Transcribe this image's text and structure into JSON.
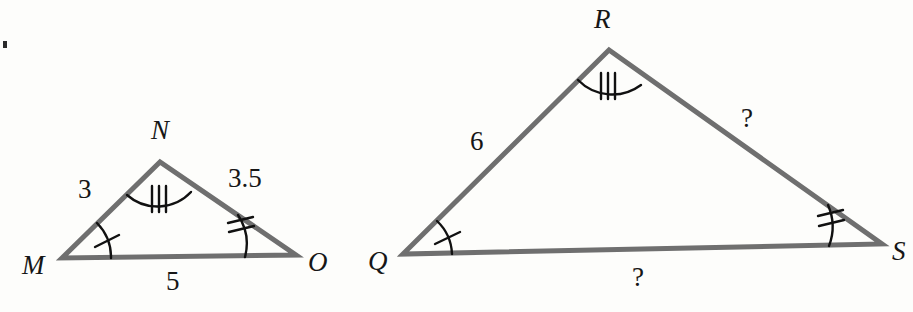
{
  "figure": {
    "background_color": "#fdfdfb",
    "stroke_color": "#6f6f6f",
    "mark_color": "#111111",
    "text_color": "#161616",
    "stroke_width": 5,
    "mark_stroke_width": 2
  },
  "triangles": [
    {
      "name": "MNO",
      "vertices": [
        {
          "label": "M",
          "x": 62,
          "y": 258,
          "label_x": 22,
          "label_y": 252
        },
        {
          "label": "N",
          "x": 160,
          "y": 162,
          "label_x": 151,
          "label_y": 117
        },
        {
          "label": "O",
          "x": 296,
          "y": 255,
          "label_x": 308,
          "label_y": 249
        }
      ],
      "sides": [
        {
          "from": "M",
          "to": "N",
          "length_label": "3",
          "label_x": 78,
          "label_y": 176
        },
        {
          "from": "N",
          "to": "O",
          "length_label": "3.5",
          "label_x": 228,
          "label_y": 165
        },
        {
          "from": "M",
          "to": "O",
          "length_label": "5",
          "label_x": 166,
          "label_y": 268
        }
      ],
      "angle_marks": [
        {
          "at": "M",
          "ticks": 1
        },
        {
          "at": "N",
          "ticks": 3
        },
        {
          "at": "O",
          "ticks": 2
        }
      ]
    },
    {
      "name": "QRS",
      "vertices": [
        {
          "label": "Q",
          "x": 403,
          "y": 254,
          "label_x": 368,
          "label_y": 248
        },
        {
          "label": "R",
          "x": 609,
          "y": 50,
          "label_x": 594,
          "label_y": 6
        },
        {
          "label": "S",
          "x": 882,
          "y": 244,
          "label_x": 892,
          "label_y": 238
        }
      ],
      "sides": [
        {
          "from": "Q",
          "to": "R",
          "length_label": "6",
          "label_x": 470,
          "label_y": 128
        },
        {
          "from": "R",
          "to": "S",
          "length_label": "?",
          "label_x": 741,
          "label_y": 105
        },
        {
          "from": "Q",
          "to": "S",
          "length_label": "?",
          "label_x": 632,
          "label_y": 264
        }
      ],
      "angle_marks": [
        {
          "at": "Q",
          "ticks": 1
        },
        {
          "at": "R",
          "ticks": 3
        },
        {
          "at": "S",
          "ticks": 2
        }
      ]
    }
  ],
  "artifacts": [
    {
      "name": "scan-speck",
      "x": 3,
      "y": 41
    }
  ]
}
